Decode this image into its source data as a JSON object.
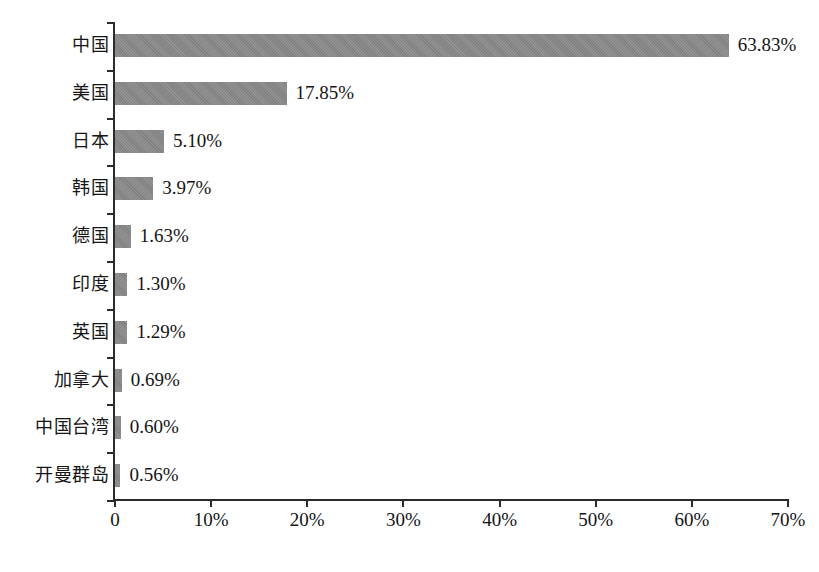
{
  "chart_data": {
    "type": "bar",
    "orientation": "horizontal",
    "title": "",
    "subtitle": "",
    "xlabel": "",
    "ylabel": "",
    "categories": [
      "中国",
      "美国",
      "日本",
      "韩国",
      "德国",
      "印度",
      "英国",
      "加拿大",
      "中国台湾",
      "开曼群岛"
    ],
    "values": [
      63.83,
      17.85,
      5.1,
      3.97,
      1.63,
      1.3,
      1.29,
      0.69,
      0.6,
      0.56
    ],
    "value_labels": [
      "63.83%",
      "17.85%",
      "5.10%",
      "3.97%",
      "1.63%",
      "1.30%",
      "1.29%",
      "0.69%",
      "0.60%",
      "0.56%"
    ],
    "xlim": [
      0,
      70
    ],
    "x_ticks": [
      0,
      10,
      20,
      30,
      40,
      50,
      60,
      70
    ],
    "x_tick_labels": [
      "0",
      "10%",
      "20%",
      "30%",
      "40%",
      "50%",
      "60%",
      "70%"
    ],
    "grid": false,
    "legend": null,
    "legend_position": "none",
    "bar_color": "#888888",
    "axis_color": "#2b2b2b",
    "background_color": "#ffffff"
  },
  "series": [
    {
      "category": "中国",
      "value": 63.83,
      "label": "63.83%"
    },
    {
      "category": "美国",
      "value": 17.85,
      "label": "17.85%"
    },
    {
      "category": "日本",
      "value": 5.1,
      "label": "5.10%"
    },
    {
      "category": "韩国",
      "value": 3.97,
      "label": "3.97%"
    },
    {
      "category": "德国",
      "value": 1.63,
      "label": "1.63%"
    },
    {
      "category": "印度",
      "value": 1.3,
      "label": "1.30%"
    },
    {
      "category": "英国",
      "value": 1.29,
      "label": "1.29%"
    },
    {
      "category": "加拿大",
      "value": 0.69,
      "label": "0.69%"
    },
    {
      "category": "中国台湾",
      "value": 0.6,
      "label": "0.60%"
    },
    {
      "category": "开曼群岛",
      "value": 0.56,
      "label": "0.56%"
    }
  ],
  "axis": {
    "x_tick_labels": [
      "0",
      "10%",
      "20%",
      "30%",
      "40%",
      "50%",
      "60%",
      "70%"
    ]
  }
}
